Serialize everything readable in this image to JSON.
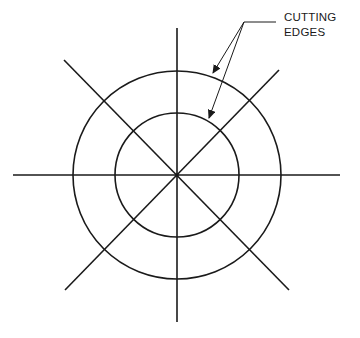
{
  "diagram": {
    "label": {
      "line1": "CUTTING",
      "line2": "EDGES"
    },
    "colors": {
      "stroke": "#1a1a1a",
      "background": "#ffffff"
    },
    "geometry": {
      "center": [
        177,
        175
      ],
      "outer_circle_radius": 103,
      "inner_circle_radius": 62,
      "radial_lines": 4
    }
  }
}
